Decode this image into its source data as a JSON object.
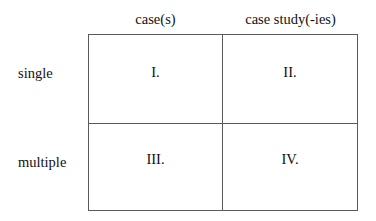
{
  "figure": {
    "type": "2x2-matrix-table",
    "column_headers": [
      "case(s)",
      "case study(-ies)"
    ],
    "row_headers": [
      "single",
      "multiple"
    ],
    "cells": [
      [
        "I.",
        "II."
      ],
      [
        "III.",
        "IV."
      ]
    ],
    "colors": {
      "border": "#5a5a5a",
      "text": "#111111",
      "background": "#ffffff"
    }
  }
}
